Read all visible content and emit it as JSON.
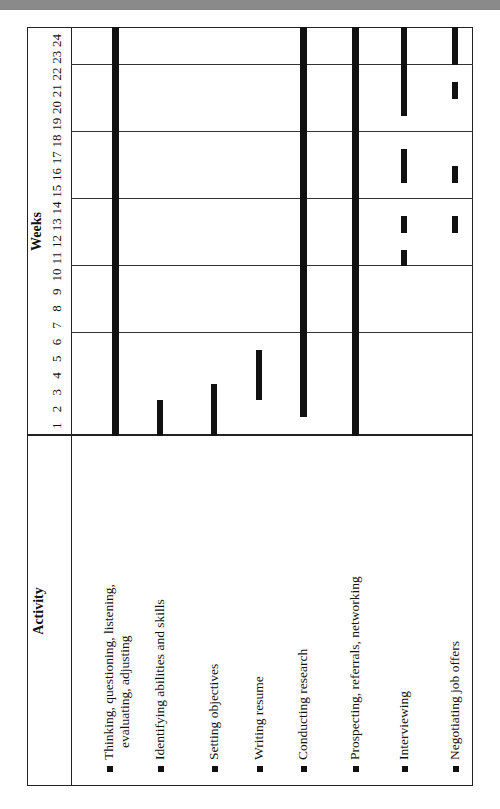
{
  "chart_data": {
    "type": "gantt",
    "title": "",
    "orientation": "rotated 90° counter-clockwise",
    "header": {
      "activity": "Activity",
      "weeks": "Weeks"
    },
    "weeks": [
      1,
      2,
      3,
      4,
      5,
      6,
      7,
      8,
      9,
      10,
      11,
      12,
      13,
      14,
      15,
      16,
      17,
      18,
      19,
      20,
      21,
      22,
      23,
      24
    ],
    "gridlines_after_weeks": [
      6,
      10,
      14,
      18,
      22
    ],
    "activities": [
      {
        "label": "Thinking, questioning, listening,",
        "label_cont": "evaluating, adjusting",
        "spans": [
          [
            1,
            24
          ]
        ],
        "thickness": "thick"
      },
      {
        "label": "Identifying abilities and skills",
        "label_cont": "",
        "spans": [
          [
            1,
            2
          ]
        ],
        "thickness": "thin"
      },
      {
        "label": "Setting objectives",
        "label_cont": "",
        "spans": [
          [
            1,
            3
          ]
        ],
        "thickness": "thin"
      },
      {
        "label": "Writing resume",
        "label_cont": "",
        "spans": [
          [
            3,
            5
          ]
        ],
        "thickness": "thin"
      },
      {
        "label": "Conducting research",
        "label_cont": "",
        "spans": [
          [
            2,
            24
          ]
        ],
        "thickness": "thick"
      },
      {
        "label": "Prospecting, referrals, networking",
        "label_cont": "",
        "spans": [
          [
            1,
            24
          ]
        ],
        "thickness": "thick"
      },
      {
        "label": "Interviewing",
        "label_cont": "",
        "spans": [
          [
            11,
            11
          ],
          [
            13,
            13
          ],
          [
            16,
            17
          ],
          [
            20,
            22
          ],
          [
            23,
            24
          ]
        ],
        "thickness": "thin"
      },
      {
        "label": "Negotiating job offers",
        "label_cont": "",
        "spans": [
          [
            13,
            13
          ],
          [
            16,
            16
          ],
          [
            21,
            21
          ],
          [
            23,
            23
          ],
          [
            24,
            24
          ]
        ],
        "thickness": "thin"
      }
    ]
  },
  "colors": {
    "bar": "#111111",
    "grid": "#222222",
    "background": "#ffffff"
  }
}
